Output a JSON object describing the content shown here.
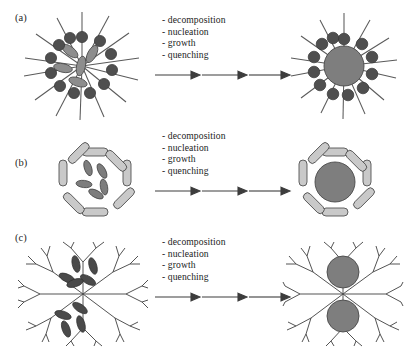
{
  "figure": {
    "kind": "scientific-schematic",
    "background": "#ffffff",
    "colors": {
      "dot_dark": "#4f4f4f",
      "core_gray": "#7e7e7e",
      "ellipse_gray": "#8a8a8a",
      "ellipse_dark": "#555555",
      "cage_fill": "#c9c9c9",
      "line": "#555555",
      "outline": "#3a3a3a",
      "text": "#1b1b1b"
    },
    "process_steps": [
      "- decomposition",
      "- nucleation",
      "- growth",
      "- quenching"
    ],
    "arrow_count": 3
  },
  "panels": [
    {
      "id": "a",
      "label": "(a)",
      "left_structure": "micelle-with-precursor-ellipses",
      "right_structure": "micelle-with-nanoparticle-core",
      "left_dot_count": 12,
      "left_ellipse_count": 5,
      "right_dot_count": 12,
      "right_core_count": 1
    },
    {
      "id": "b",
      "label": "(b)",
      "left_structure": "octagonal-cage-with-precursor-ellipses",
      "right_structure": "octagonal-cage-with-nanoparticle-core",
      "cage_segment_count": 8,
      "left_ellipse_count": 5,
      "right_core_count": 1
    },
    {
      "id": "c",
      "label": "(c)",
      "left_structure": "dendritic-polymer-with-precursor-ellipses",
      "right_structure": "dendritic-polymer-with-two-nanoparticle-cores",
      "left_ellipse_count": 9,
      "right_core_count": 2
    }
  ]
}
